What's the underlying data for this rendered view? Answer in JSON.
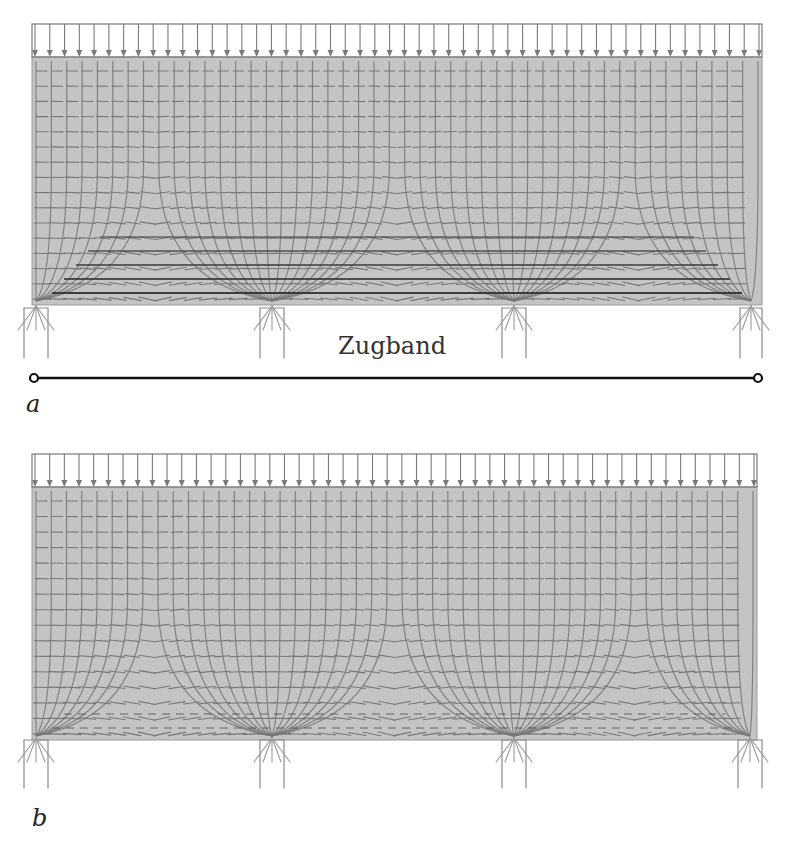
{
  "figure": {
    "colors": {
      "beam_fill": "#c4c4c4",
      "trajectory": "#777777",
      "trajectory_dark": "#3c3c3c",
      "load": "#7a7a7a",
      "support": "#8a8a8a",
      "tie": "#111111"
    },
    "panels": [
      {
        "id": "a",
        "label": "a",
        "has_tie": true,
        "tie_label": "Zugband",
        "beam": {
          "x": 32,
          "y": 57,
          "w": 730,
          "h": 248
        },
        "load_box": {
          "x": 32,
          "y": 24,
          "w": 730,
          "h": 33,
          "arrow_count": 50
        },
        "supports": [
          {
            "x": 24,
            "w": 24,
            "y": 308,
            "h": 50
          },
          {
            "x": 260,
            "w": 24,
            "y": 308,
            "h": 50
          },
          {
            "x": 502,
            "w": 24,
            "y": 308,
            "h": 50
          },
          {
            "x": 740,
            "w": 22,
            "y": 308,
            "h": 50
          }
        ],
        "tie": {
          "x1": 34,
          "x2": 758,
          "y": 378
        },
        "label_pos": {
          "x": 26,
          "y": 392
        }
      },
      {
        "id": "b",
        "label": "b",
        "has_tie": false,
        "beam": {
          "x": 32,
          "y": 487,
          "w": 725,
          "h": 253
        },
        "load_box": {
          "x": 32,
          "y": 454,
          "w": 725,
          "h": 33,
          "arrow_count": 50
        },
        "supports": [
          {
            "x": 24,
            "w": 24,
            "y": 740,
            "h": 48
          },
          {
            "x": 260,
            "w": 24,
            "y": 740,
            "h": 48
          },
          {
            "x": 502,
            "w": 24,
            "y": 740,
            "h": 48
          },
          {
            "x": 738,
            "w": 24,
            "y": 740,
            "h": 48
          }
        ],
        "label_pos": {
          "x": 34,
          "y": 806
        }
      }
    ]
  }
}
